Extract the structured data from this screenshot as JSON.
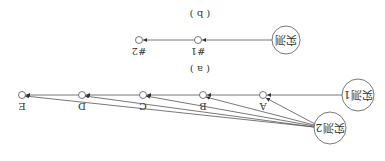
{
  "orientation": "rotated-180",
  "diagram_a": {
    "caption": "( a )",
    "sources": [
      {
        "id": "m1",
        "label": "实测1"
      },
      {
        "id": "m2",
        "label": "实测2"
      }
    ],
    "nodes": [
      {
        "id": "A",
        "label": "A"
      },
      {
        "id": "B",
        "label": "B"
      },
      {
        "id": "C",
        "label": "C"
      },
      {
        "id": "D",
        "label": "D"
      },
      {
        "id": "E",
        "label": "E"
      }
    ],
    "edges": [
      [
        "m1",
        "A"
      ],
      [
        "A",
        "B"
      ],
      [
        "B",
        "C"
      ],
      [
        "C",
        "D"
      ],
      [
        "D",
        "E"
      ],
      [
        "m2",
        "A"
      ],
      [
        "m2",
        "B"
      ],
      [
        "m2",
        "C"
      ],
      [
        "m2",
        "D"
      ],
      [
        "m2",
        "E"
      ]
    ]
  },
  "diagram_b": {
    "caption": "( b )",
    "source": {
      "id": "m",
      "label": "实测"
    },
    "nodes": [
      {
        "id": "n1",
        "label": "#1"
      },
      {
        "id": "n2",
        "label": "#2"
      }
    ],
    "edges": [
      [
        "m",
        "n1"
      ],
      [
        "n1",
        "n2"
      ]
    ]
  },
  "colors": {
    "stroke": "#555555",
    "text": "#333333",
    "background": "#ffffff"
  }
}
